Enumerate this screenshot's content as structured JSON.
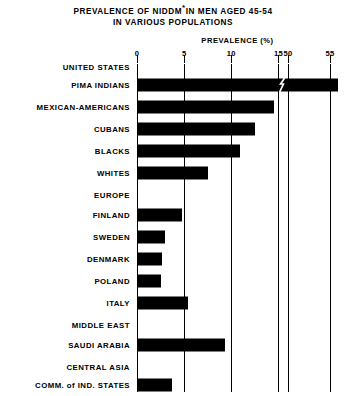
{
  "title": {
    "line1_pre": "PREVALENCE OF NIDDM",
    "line1_sup": "*",
    "line1_post": "IN MEN AGED 45-54",
    "line2": "IN VARIOUS POPULATIONS"
  },
  "axis": {
    "label": "PREVALENCE (%)",
    "ticks": [
      "0",
      "5",
      "10",
      "15",
      "50",
      "55"
    ]
  },
  "chart_data": {
    "type": "bar",
    "orientation": "horizontal",
    "xlabel": "PREVALENCE (%)",
    "ylabel": "",
    "grid": true,
    "legend": null,
    "broken_axis": true,
    "axis_break_between": [
      16,
      49
    ],
    "xlim": [
      0,
      56.5
    ],
    "xticks": [
      0,
      5,
      10,
      15,
      50,
      55
    ],
    "categories": [
      "UNITED STATES",
      "PIMA INDIANS",
      "MEXICAN-AMERICANS",
      "CUBANS",
      "BLACKS",
      "WHITES",
      "EUROPE",
      "FINLAND",
      "SWEDEN",
      "DENMARK",
      "POLAND",
      "ITALY",
      "MIDDLE EAST",
      "SAUDI ARABIA",
      "CENTRAL ASIA",
      "COMM. of IND. STATES",
      "ASIA",
      "SHANGHAI, CHINA†",
      "YAMAGATA, JAPAN"
    ],
    "values": [
      null,
      56.0,
      14.5,
      12.5,
      10.9,
      7.5,
      null,
      4.8,
      3.0,
      2.7,
      2.5,
      5.4,
      null,
      9.3,
      null,
      3.7,
      null,
      2.1,
      3.2
    ],
    "footnotes": [
      "* NIDDM",
      "† SHANGHAI, CHINA"
    ]
  },
  "rows": [
    {
      "label": "UNITED STATES",
      "sup": "",
      "group": true,
      "value": null,
      "y": 4
    },
    {
      "label": "PIMA INDIANS",
      "sup": "",
      "group": false,
      "value": 56.0,
      "y": 22
    },
    {
      "label": "MEXICAN-AMERICANS",
      "sup": "",
      "group": false,
      "value": 14.5,
      "y": 44
    },
    {
      "label": "CUBANS",
      "sup": "",
      "group": false,
      "value": 12.5,
      "y": 66
    },
    {
      "label": "BLACKS",
      "sup": "",
      "group": false,
      "value": 10.9,
      "y": 88
    },
    {
      "label": "WHITES",
      "sup": "",
      "group": false,
      "value": 7.5,
      "y": 110
    },
    {
      "label": "EUROPE",
      "sup": "",
      "group": true,
      "value": null,
      "y": 132
    },
    {
      "label": "FINLAND",
      "sup": "",
      "group": false,
      "value": 4.8,
      "y": 152
    },
    {
      "label": "SWEDEN",
      "sup": "",
      "group": false,
      "value": 3.0,
      "y": 174
    },
    {
      "label": "DENMARK",
      "sup": "",
      "group": false,
      "value": 2.7,
      "y": 196
    },
    {
      "label": "POLAND",
      "sup": "",
      "group": false,
      "value": 2.5,
      "y": 218
    },
    {
      "label": "ITALY",
      "sup": "",
      "group": false,
      "value": 5.4,
      "y": 240
    },
    {
      "label": "MIDDLE EAST",
      "sup": "",
      "group": true,
      "value": null,
      "y": 262
    },
    {
      "label": "SAUDI ARABIA",
      "sup": "",
      "group": false,
      "value": 9.3,
      "y": 282
    },
    {
      "label": "CENTRAL ASIA",
      "sup": "",
      "group": true,
      "value": null,
      "y": 304
    },
    {
      "label": "COMM. of IND. STATES",
      "sup": "",
      "group": false,
      "value": 3.7,
      "y": 322
    },
    {
      "label": "ASIA",
      "sup": "",
      "group": true,
      "value": null,
      "y": 344
    },
    {
      "label": "SHANGHAI, CHINA",
      "sup": "†",
      "group": false,
      "value": 2.1,
      "y": 362
    },
    {
      "label": "YAMAGATA, JAPAN",
      "sup": "",
      "group": false,
      "value": 3.2,
      "y": 384
    }
  ],
  "colors": {
    "bar": "#000000",
    "axis": "#000000",
    "background": "#ffffff"
  }
}
